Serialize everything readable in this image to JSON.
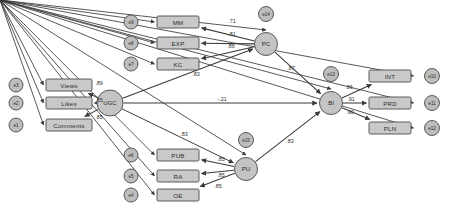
{
  "diagram": {
    "type": "sem-path-diagram",
    "colors": {
      "box_fill": "#c9c9c9",
      "circle_fill": "#c4c4c4",
      "stroke": "#4a4a4a",
      "edge": "#3a3a3a",
      "background": "#ffffff"
    }
  },
  "latents": [
    {
      "id": "UGC",
      "label": "UGC",
      "cx": 110,
      "cy": 103,
      "r": 13
    },
    {
      "id": "PC",
      "label": "PC",
      "cx": 266,
      "cy": 44,
      "r": 11.5
    },
    {
      "id": "PU",
      "label": "PU",
      "cx": 246,
      "cy": 169,
      "r": 11.5
    },
    {
      "id": "BI",
      "label": "BI",
      "cx": 331,
      "cy": 103,
      "r": 11.5
    }
  ],
  "observed": [
    {
      "id": "views",
      "label": "Views",
      "x": 46,
      "y": 79,
      "w": 46,
      "h": 12
    },
    {
      "id": "likes",
      "label": "Likes",
      "x": 46,
      "y": 97,
      "w": 46,
      "h": 12
    },
    {
      "id": "comments",
      "label": "Comments",
      "x": 46,
      "y": 119,
      "w": 46,
      "h": 12
    },
    {
      "id": "MM",
      "label": "MM",
      "x": 157,
      "y": 16,
      "w": 42,
      "h": 12
    },
    {
      "id": "EXP",
      "label": "EXP",
      "x": 157,
      "y": 37,
      "w": 42,
      "h": 12
    },
    {
      "id": "KC",
      "label": "KC",
      "x": 157,
      "y": 58,
      "w": 42,
      "h": 12
    },
    {
      "id": "PUB",
      "label": "PUB",
      "x": 157,
      "y": 149,
      "w": 42,
      "h": 12
    },
    {
      "id": "RA",
      "label": "RA",
      "x": 157,
      "y": 170,
      "w": 42,
      "h": 12
    },
    {
      "id": "OE",
      "label": "OE",
      "x": 157,
      "y": 189,
      "w": 42,
      "h": 12
    },
    {
      "id": "INT",
      "label": "INT",
      "x": 369,
      "y": 70,
      "w": 42,
      "h": 12
    },
    {
      "id": "PRD",
      "label": "PRD",
      "x": 369,
      "y": 97,
      "w": 42,
      "h": 12
    },
    {
      "id": "PLN",
      "label": "PLN",
      "x": 369,
      "y": 122,
      "w": 42,
      "h": 12
    }
  ],
  "errors": [
    {
      "id": "e1",
      "label": "e1",
      "cx": 16,
      "cy": 125,
      "r": 7
    },
    {
      "id": "e2",
      "label": "e2",
      "cx": 16,
      "cy": 103,
      "r": 7
    },
    {
      "id": "e3",
      "label": "e3",
      "cx": 16,
      "cy": 85,
      "r": 7
    },
    {
      "id": "e4",
      "label": "e4",
      "cx": 131,
      "cy": 195,
      "r": 7
    },
    {
      "id": "e5",
      "label": "e5",
      "cx": 131,
      "cy": 176,
      "r": 7
    },
    {
      "id": "e6",
      "label": "e6",
      "cx": 131,
      "cy": 155,
      "r": 7
    },
    {
      "id": "e7",
      "label": "e7",
      "cx": 131,
      "cy": 64,
      "r": 7
    },
    {
      "id": "e8",
      "label": "e8",
      "cx": 131,
      "cy": 43,
      "r": 7
    },
    {
      "id": "e9",
      "label": "e9",
      "cx": 131,
      "cy": 22,
      "r": 7
    },
    {
      "id": "e10",
      "label": "e10",
      "cx": 432,
      "cy": 76,
      "r": 7.5
    },
    {
      "id": "e11",
      "label": "e11",
      "cx": 432,
      "cy": 103,
      "r": 7.5
    },
    {
      "id": "e12",
      "label": "e12",
      "cx": 432,
      "cy": 128,
      "r": 7.5
    },
    {
      "id": "e13",
      "label": "e13",
      "cx": 331,
      "cy": 74,
      "r": 7.5
    },
    {
      "id": "e14",
      "label": "e14",
      "cx": 266,
      "cy": 14,
      "r": 7.5
    },
    {
      "id": "e15",
      "label": "e15",
      "cx": 246,
      "cy": 140,
      "r": 7.5
    }
  ],
  "paths": [
    {
      "from": "UGC",
      "to": "views",
      "coef": ".89",
      "lx": 99,
      "ly": 83,
      "kind": "loading"
    },
    {
      "from": "UGC",
      "to": "likes",
      "coef": ".85",
      "lx": 99,
      "ly": 100,
      "kind": "loading"
    },
    {
      "from": "UGC",
      "to": "comments",
      "coef": ".85",
      "lx": 99,
      "ly": 117,
      "kind": "loading"
    },
    {
      "from": "PC",
      "to": "MM",
      "coef": ".71",
      "lx": 232,
      "ly": 21,
      "kind": "loading"
    },
    {
      "from": "PC",
      "to": "EXP",
      "coef": ".81",
      "lx": 232,
      "ly": 34,
      "kind": "loading"
    },
    {
      "from": "PC",
      "to": "KC",
      "coef": ".86",
      "lx": 231,
      "ly": 46,
      "kind": "loading"
    },
    {
      "from": "PU",
      "to": "PUB",
      "coef": ".85",
      "lx": 221,
      "ly": 159,
      "kind": "loading"
    },
    {
      "from": "PU",
      "to": "RA",
      "coef": ".85",
      "lx": 221,
      "ly": 175,
      "kind": "loading"
    },
    {
      "from": "PU",
      "to": "OE",
      "coef": ".85",
      "lx": 218,
      "ly": 186,
      "kind": "loading"
    },
    {
      "from": "BI",
      "to": "INT",
      "coef": ".86",
      "lx": 349,
      "ly": 87,
      "kind": "loading"
    },
    {
      "from": "BI",
      "to": "PRD",
      "coef": ".91",
      "lx": 351,
      "ly": 99,
      "kind": "loading"
    },
    {
      "from": "BI",
      "to": "PLN",
      "coef": ".90",
      "lx": 350,
      "ly": 112,
      "kind": "loading"
    },
    {
      "from": "UGC",
      "to": "PC",
      "coef": ".83",
      "lx": 196,
      "ly": 74,
      "kind": "structural"
    },
    {
      "from": "UGC",
      "to": "PU",
      "coef": ".83",
      "lx": 184,
      "ly": 134,
      "kind": "structural"
    },
    {
      "from": "UGC",
      "to": "BI",
      "coef": "-.21",
      "lx": 222,
      "ly": 99,
      "kind": "structural"
    },
    {
      "from": "PC",
      "to": "BI",
      "coef": ".87",
      "lx": 291,
      "ly": 68,
      "kind": "structural"
    },
    {
      "from": "PU",
      "to": "BI",
      "coef": ".83",
      "lx": 290,
      "ly": 141,
      "kind": "structural"
    }
  ]
}
